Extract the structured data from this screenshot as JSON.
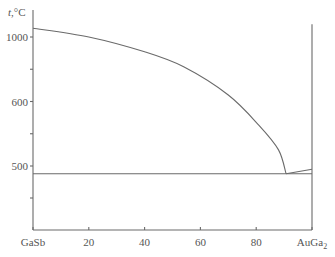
{
  "chart_data": {
    "type": "line",
    "title": "",
    "ylabel_italic": "t",
    "ylabel_rest": ",°C",
    "xlabel": "",
    "x_tick_labels": [
      {
        "value": 0,
        "label": "GaSb"
      },
      {
        "value": 20,
        "label": "20"
      },
      {
        "value": 40,
        "label": "40"
      },
      {
        "value": 60,
        "label": "60"
      },
      {
        "value": 80,
        "label": "80"
      },
      {
        "value": 100,
        "label": "AuGa",
        "subscript": "2"
      }
    ],
    "xlim": [
      0,
      100
    ],
    "y_scale_note": "non-linear axis: 400–600 and 600–1000 segments compressed differently",
    "y_ticks": [
      {
        "value": 400,
        "label": ""
      },
      {
        "value": 450,
        "label": ""
      },
      {
        "value": 500,
        "label": "500"
      },
      {
        "value": 550,
        "label": ""
      },
      {
        "value": 600,
        "label": "600"
      },
      {
        "value": 800,
        "label": ""
      },
      {
        "value": 1000,
        "label": "1000"
      }
    ],
    "ylim": [
      400,
      1100
    ],
    "grid": false,
    "series": [
      {
        "name": "liquidus-GaSb-side",
        "x": [
          0,
          20,
          40,
          54,
          70,
          81,
          88,
          90.7
        ],
        "y": [
          1055,
          1000,
          908,
          815,
          640,
          563,
          525,
          488
        ]
      },
      {
        "name": "liquidus-AuGa2-side",
        "x": [
          90.7,
          100
        ],
        "y": [
          488,
          495
        ]
      },
      {
        "name": "eutectic-horizontal",
        "x": [
          0,
          100
        ],
        "y": [
          488,
          488
        ]
      },
      {
        "name": "AuGa2-compound-vertical",
        "x": [
          100,
          100
        ],
        "y": [
          400,
          1080
        ]
      }
    ],
    "eutectic": {
      "x": 90.7,
      "t": 488
    }
  }
}
